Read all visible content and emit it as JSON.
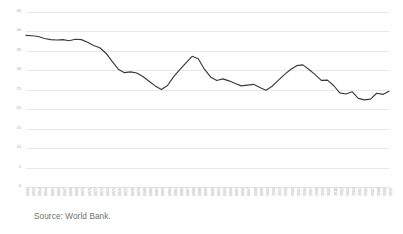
{
  "source_note": "Source: World Bank.",
  "colors": {
    "line": "#3a3a3a",
    "gridline": "#e8e8e8",
    "tick_label": "#9a9a9a",
    "source_text": "#6e6e6e",
    "background": "#ffffff"
  },
  "chart_data": {
    "type": "line",
    "title": "",
    "subtitle": "",
    "xlabel": "",
    "ylabel": "",
    "ylim": [
      0,
      45
    ],
    "yticks": [
      0,
      5,
      10,
      15,
      20,
      25,
      30,
      35,
      40,
      45
    ],
    "ytick_labels": [
      "0",
      "5",
      "10",
      "15",
      "20",
      "25",
      "30",
      "35",
      "40",
      "45"
    ],
    "grid": true,
    "legend": null,
    "legend_position": "none",
    "annotations": [],
    "x": [
      1961,
      1962,
      1963,
      1964,
      1965,
      1966,
      1967,
      1968,
      1969,
      1970,
      1971,
      1972,
      1973,
      1974,
      1975,
      1976,
      1977,
      1978,
      1979,
      1980,
      1981,
      1982,
      1983,
      1984,
      1985,
      1986,
      1987,
      1988,
      1989,
      1990,
      1991,
      1992,
      1993,
      1994,
      1995,
      1996,
      1997,
      1998,
      1999,
      2000,
      2001,
      2002,
      2003,
      2004,
      2005,
      2006,
      2007,
      2008,
      2009,
      2010,
      2011,
      2012,
      2013,
      2014,
      2015,
      2016,
      2017,
      2018,
      2019,
      2020
    ],
    "categories": [
      "1961",
      "1962",
      "1963",
      "1964",
      "1965",
      "1966",
      "1967",
      "1968",
      "1969",
      "1970",
      "1971",
      "1972",
      "1973",
      "1974",
      "1975",
      "1976",
      "1977",
      "1978",
      "1979",
      "1980",
      "1981",
      "1982",
      "1983",
      "1984",
      "1985",
      "1986",
      "1987",
      "1988",
      "1989",
      "1990",
      "1991",
      "1992",
      "1993",
      "1994",
      "1995",
      "1996",
      "1997",
      "1998",
      "1999",
      "2000",
      "2001",
      "2002",
      "2003",
      "2004",
      "2005",
      "2006",
      "2007",
      "2008",
      "2009",
      "2010",
      "2011",
      "2012",
      "2013",
      "2014",
      "2015",
      "2016",
      "2017",
      "2018",
      "2019",
      "2020"
    ],
    "values": [
      39.0,
      38.9,
      38.7,
      38.2,
      37.9,
      37.8,
      37.9,
      37.6,
      38.0,
      37.9,
      37.2,
      36.4,
      35.8,
      34.4,
      32.3,
      30.3,
      29.4,
      29.6,
      29.3,
      28.4,
      27.2,
      26.0,
      25.1,
      26.1,
      28.4,
      30.2,
      31.9,
      33.6,
      33.0,
      30.3,
      28.3,
      27.4,
      27.8,
      27.3,
      26.6,
      26.0,
      26.2,
      26.4,
      25.6,
      24.9,
      25.9,
      27.4,
      28.9,
      30.2,
      31.2,
      31.4,
      30.2,
      28.9,
      27.4,
      27.5,
      26.1,
      24.2,
      23.9,
      24.5,
      22.8,
      22.4,
      22.6,
      24.1,
      23.8,
      24.6
    ]
  }
}
